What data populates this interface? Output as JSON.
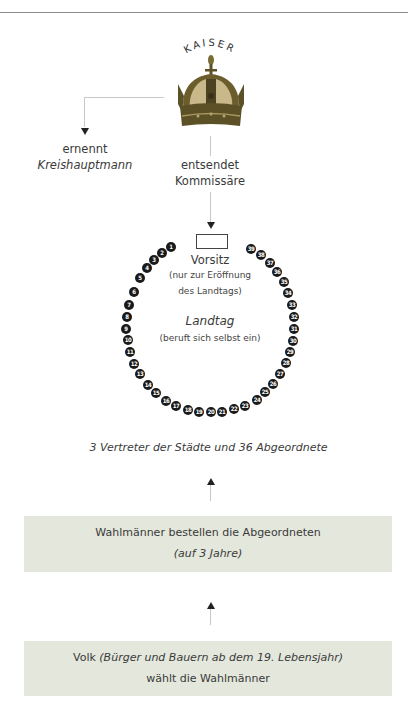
{
  "diagram": {
    "title": "KAISER",
    "emperor": {
      "label": "KAISER",
      "icon": "crown-icon"
    },
    "left_branch": {
      "verb": "ernennt",
      "object": "Kreishauptmann"
    },
    "center_branch": {
      "line1": "entsendet",
      "line2": "Kommissäre"
    },
    "chair": {
      "label": "Vorsitz",
      "note_line1": "(nur zur Eröffnung",
      "note_line2": "des Landtags)"
    },
    "assembly": {
      "label": "Landtag",
      "note": "(beruft sich selbst ein)"
    },
    "composition": "3 Vertreter der Städte und 36 Abgeordnete",
    "seats": [
      "1",
      "2",
      "3",
      "4",
      "5",
      "6",
      "7",
      "8",
      "9",
      "10",
      "11",
      "12",
      "13",
      "14",
      "15",
      "16",
      "17",
      "18",
      "19",
      "20",
      "21",
      "22",
      "23",
      "24",
      "25",
      "26",
      "27",
      "28",
      "29",
      "30",
      "31",
      "32",
      "33",
      "34",
      "35",
      "36",
      "37",
      "38",
      "39"
    ],
    "electors_box": {
      "line1": "Wahlmänner bestellen die Abgeordneten",
      "line2": "(auf 3 Jahre)"
    },
    "people_box": {
      "line1_normal": "Volk ",
      "line1_italic": "(Bürger und Bauern ab dem 19. Lebensjahr)",
      "line2": "wählt die Wahlmänner"
    }
  },
  "colors": {
    "box_fill": "#e3e7dc",
    "seat_fill": "#1a1a1a",
    "connector": "#c8c8c8",
    "crown_gold": "#8a7a3a"
  }
}
